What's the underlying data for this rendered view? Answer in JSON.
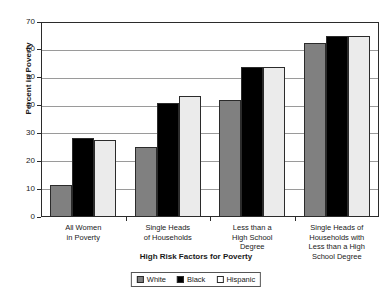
{
  "chart_data": {
    "type": "bar",
    "title": "",
    "xlabel": "High Risk Factors for Poverty",
    "ylabel": "Percent in Poverty",
    "ylim": [
      0,
      70
    ],
    "yticks": [
      0,
      10,
      20,
      30,
      40,
      50,
      60,
      70
    ],
    "grid": true,
    "legend_position": "bottom",
    "categories": [
      "All Women in Poverty",
      "Single Heads of Households",
      "Less than a High School Degree",
      "Single Heads of Households with Less than a High School Degree"
    ],
    "category_lines": [
      [
        "All Women",
        "in Poverty"
      ],
      [
        "Single Heads",
        "of Households"
      ],
      [
        "Less than a",
        "High School",
        "Degree"
      ],
      [
        "Single Heads of",
        "Households with",
        "Less than a High",
        "School Degree"
      ]
    ],
    "series": [
      {
        "name": "White",
        "color": "#808080",
        "values": [
          11.5,
          25.0,
          42.0,
          62.5
        ]
      },
      {
        "name": "Black",
        "color": "#000000",
        "values": [
          28.5,
          41.0,
          54.0,
          65.0
        ]
      },
      {
        "name": "Hispanic",
        "color": "#ebebeb",
        "values": [
          27.8,
          43.5,
          54.0,
          65.0
        ]
      }
    ]
  },
  "legend": {
    "items": [
      {
        "label": "White"
      },
      {
        "label": "Black"
      },
      {
        "label": "Hispanic"
      }
    ]
  }
}
